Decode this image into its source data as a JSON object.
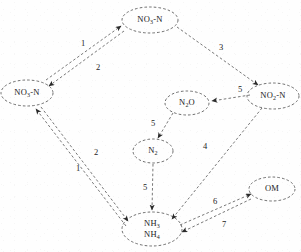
{
  "figure": {
    "type": "nitrogen-cycle-flow-diagram",
    "width": 301,
    "height": 252,
    "background_color": "#fefefe",
    "node_stroke_color": "#4a4a4a",
    "edge_stroke_color": "#555555",
    "text_color": "#1b1b1b",
    "line_style": "dashed"
  },
  "nodes": [
    {
      "id": "no3n-top",
      "label_html": "NO<sub>3</sub>-N",
      "label_text": "NO3-N",
      "cx": 150,
      "cy": 20,
      "rx": 28,
      "ry": 13,
      "lines": 1
    },
    {
      "id": "no3n-left",
      "label_html": "NO<sub>3</sub>-N",
      "label_text": "NO3-N",
      "cx": 27,
      "cy": 93,
      "rx": 26,
      "ry": 13,
      "lines": 1
    },
    {
      "id": "no2n-right",
      "label_html": "NO<sub>2</sub>-N",
      "label_text": "NO2-N",
      "cx": 273,
      "cy": 96,
      "rx": 26,
      "ry": 13,
      "lines": 1
    },
    {
      "id": "n2o",
      "label_html": "N<sub>2</sub>O",
      "label_text": "N2O",
      "cx": 187,
      "cy": 103,
      "rx": 22,
      "ry": 12,
      "lines": 1
    },
    {
      "id": "n2",
      "label_html": "N<sub>2</sub>",
      "label_text": "N2",
      "cx": 153,
      "cy": 151,
      "rx": 20,
      "ry": 12,
      "lines": 1
    },
    {
      "id": "nh3-nh4",
      "label_html": "NH<sub>3</sub><br>NH<sub>4</sub>",
      "label_text": "NH3 NH4",
      "cx": 152,
      "cy": 229,
      "rx": 30,
      "ry": 17,
      "lines": 2
    },
    {
      "id": "om",
      "label_html": "OM",
      "label_text": "OM",
      "cx": 272,
      "cy": 189,
      "rx": 23,
      "ry": 12,
      "lines": 1
    }
  ],
  "edges": [
    {
      "id": "e1",
      "label": "1",
      "from": "no3n-left",
      "to": "no3n-top",
      "label_x": 83,
      "label_y": 43
    },
    {
      "id": "e2",
      "label": "2",
      "from": "no3n-top",
      "to": "no3n-left",
      "label_x": 98,
      "label_y": 67
    },
    {
      "id": "e3",
      "label": "3",
      "from": "no3n-top",
      "to": "no2n-right",
      "label_x": 221,
      "label_y": 47
    },
    {
      "id": "e5a",
      "label": "5",
      "from": "no2n-right",
      "to": "n2o",
      "label_x": 240,
      "label_y": 89
    },
    {
      "id": "e5b",
      "label": "5",
      "from": "n2o",
      "to": "n2",
      "label_x": 153,
      "label_y": 123
    },
    {
      "id": "e4",
      "label": "4",
      "from": "no2n-right",
      "to": "nh3-nh4",
      "label_x": 205,
      "label_y": 146
    },
    {
      "id": "e2b",
      "label": "2",
      "from": "no3n-left",
      "to": "nh3-nh4",
      "label_x": 96,
      "label_y": 152
    },
    {
      "id": "e1b",
      "label": "1",
      "from": "nh3-nh4",
      "to": "no3n-left",
      "label_x": 78,
      "label_y": 168
    },
    {
      "id": "e5c",
      "label": "5",
      "from": "n2",
      "to": "nh3-nh4",
      "label_x": 145,
      "label_y": 187
    },
    {
      "id": "e6",
      "label": "6",
      "from": "nh3-nh4",
      "to": "om",
      "label_x": 215,
      "label_y": 201
    },
    {
      "id": "e7",
      "label": "7",
      "from": "om",
      "to": "nh3-nh4",
      "label_x": 224,
      "label_y": 224
    }
  ]
}
